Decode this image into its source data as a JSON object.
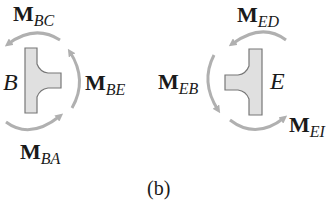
{
  "figure": {
    "caption": "(b)",
    "joint_B": {
      "label": "B",
      "moments": [
        {
          "symbol": "M",
          "subscript": "BC",
          "position": "top"
        },
        {
          "symbol": "M",
          "subscript": "BE",
          "position": "right"
        },
        {
          "symbol": "M",
          "subscript": "BA",
          "position": "bottom"
        }
      ]
    },
    "joint_E": {
      "label": "E",
      "moments": [
        {
          "symbol": "M",
          "subscript": "ED",
          "position": "top"
        },
        {
          "symbol": "M",
          "subscript": "EB",
          "position": "left"
        },
        {
          "symbol": "M",
          "subscript": "EF",
          "position": "bottom-right",
          "visible_text": "EI"
        }
      ]
    },
    "colors": {
      "arrow": "#b0b0b0",
      "joint_fill": "#e0e0e0",
      "joint_stroke": "#777777",
      "text": "#1a1a1a"
    }
  }
}
